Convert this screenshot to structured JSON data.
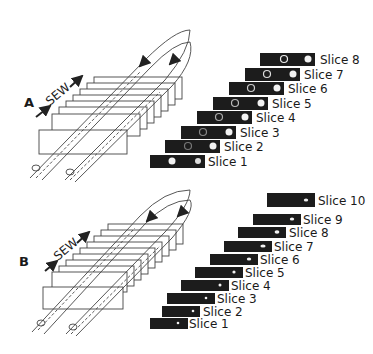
{
  "panels": [
    {
      "label": "A",
      "sew_label": "SEW",
      "slices": [
        "Slice 1",
        "Slice 2",
        "Slice 3",
        "Slice 4",
        "Slice 5",
        "Slice 6",
        "Slice 7",
        "Slice 8"
      ]
    },
    {
      "label": "B",
      "sew_label": "SEW",
      "slices": [
        "Slice 1",
        "Slice 2",
        "Slice 3",
        "Slice 4",
        "Slice 5",
        "Slice 6",
        "Slice 7",
        "Slice 8",
        "Slice 9",
        "Slice 10"
      ]
    }
  ],
  "colors": {
    "slice_bg": "#1c1c1c",
    "line": "#333333",
    "spot": "#f2f2f2"
  }
}
